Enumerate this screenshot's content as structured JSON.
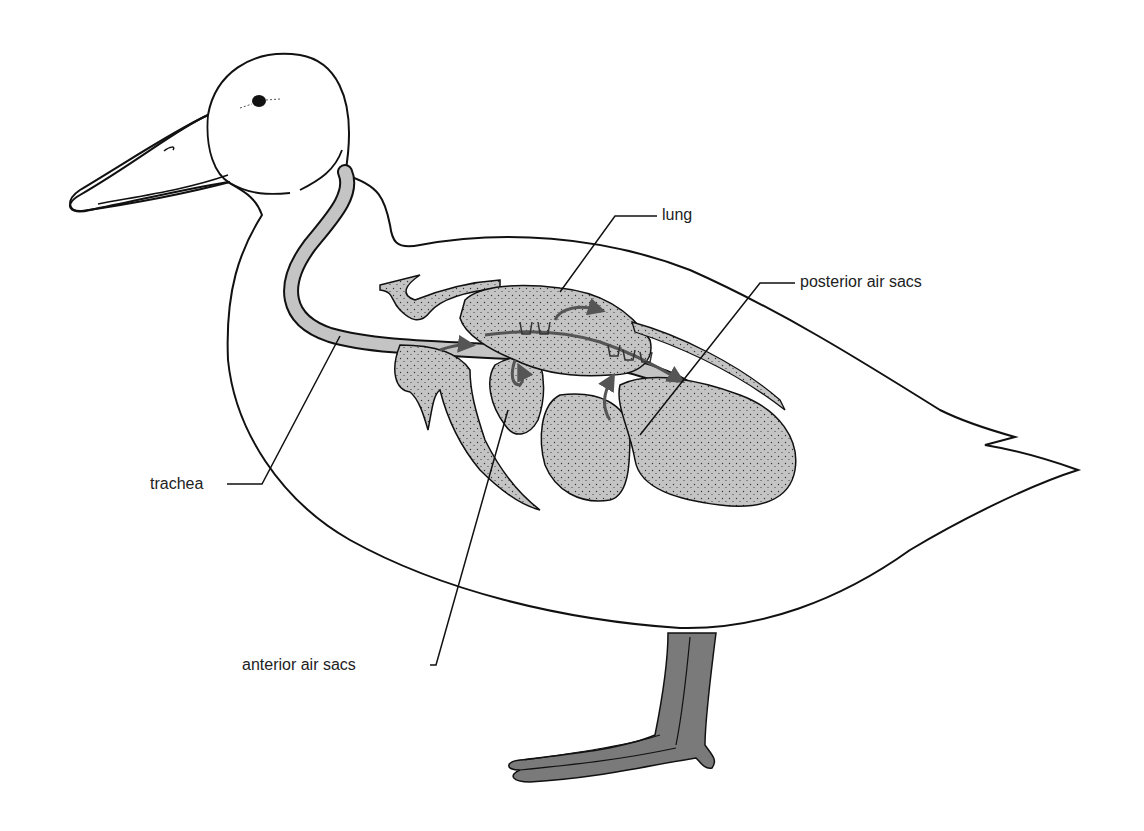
{
  "diagram": {
    "labels": {
      "lung": "lung",
      "posterior_air_sacs": "posterior air sacs",
      "trachea": "trachea",
      "anterior_air_sacs": "anterior air sacs"
    },
    "colors": {
      "outline": "#111111",
      "organ_fill": "#c4c4c4",
      "airflow_arrow": "#555555",
      "leg_fill": "#7a7a7a",
      "background": "#ffffff"
    }
  }
}
